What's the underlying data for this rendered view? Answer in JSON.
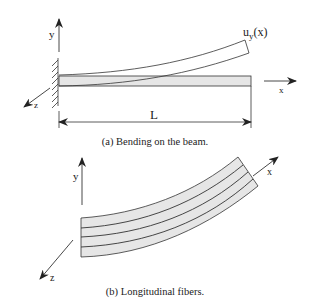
{
  "figure_a": {
    "caption": "(a)  Bending on the beam.",
    "axis_y": "y",
    "axis_x": "x",
    "axis_z": "z",
    "deflection_label_main": "u",
    "deflection_label_sub": "y",
    "deflection_label_arg": "(x)",
    "length_label": "L"
  },
  "figure_b": {
    "caption": "(b)  Longitudinal fibers.",
    "axis_y": "y",
    "axis_x": "x",
    "axis_z": "z"
  },
  "colors": {
    "beam_fill": "#e6e6e6",
    "stroke": "#333333"
  }
}
